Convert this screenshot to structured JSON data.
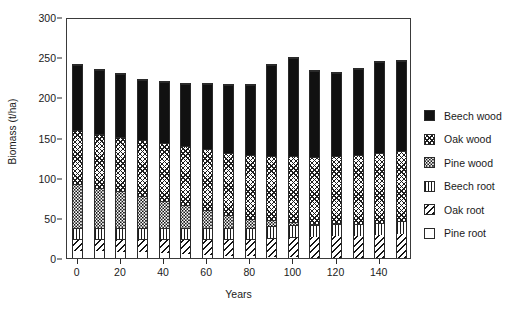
{
  "chart_data": {
    "type": "bar",
    "subtype": "stacked-bar",
    "title": "",
    "xlabel": "Years",
    "ylabel": "Biomass (t/ha)",
    "xlim": [
      -5,
      155
    ],
    "ylim": [
      0,
      300
    ],
    "ytick_values": [
      0,
      50,
      100,
      150,
      200,
      250,
      300
    ],
    "ytick_labels": [
      "0",
      "50",
      "100",
      "150",
      "200",
      "250",
      "300"
    ],
    "xtick_values": [
      0,
      20,
      40,
      60,
      80,
      100,
      120,
      140
    ],
    "xtick_labels": [
      "0",
      "20",
      "40",
      "60",
      "80",
      "100",
      "120",
      "140"
    ],
    "grid": false,
    "legend_position": "right",
    "x": [
      0,
      10,
      20,
      30,
      40,
      50,
      60,
      70,
      80,
      90,
      100,
      110,
      120,
      130,
      140,
      150
    ],
    "categories": [
      "0",
      "10",
      "20",
      "30",
      "40",
      "50",
      "60",
      "70",
      "80",
      "90",
      "100",
      "110",
      "120",
      "130",
      "140",
      "150"
    ],
    "stack_order_bottom_to_top": [
      "Pine root",
      "Oak root",
      "Beech root",
      "Pine wood",
      "Oak wood",
      "Beech wood"
    ],
    "series": [
      {
        "name": "Pine root",
        "pattern": "open-white",
        "values": [
          9,
          9,
          8,
          7,
          6,
          5,
          4,
          3,
          2,
          1,
          1,
          0,
          0,
          0,
          0,
          0
        ]
      },
      {
        "name": "Oak root",
        "pattern": "diagonal-hatch",
        "values": [
          15,
          15,
          16,
          17,
          18,
          19,
          20,
          21,
          22,
          24,
          25,
          26,
          27,
          28,
          29,
          30
        ]
      },
      {
        "name": "Beech root",
        "pattern": "vertical-lines",
        "values": [
          14,
          14,
          14,
          14,
          14,
          14,
          14,
          14,
          14,
          15,
          15,
          15,
          15,
          15,
          15,
          16
        ]
      },
      {
        "name": "Pine wood",
        "pattern": "stipple-dots",
        "values": [
          54,
          50,
          46,
          40,
          34,
          28,
          22,
          16,
          11,
          7,
          4,
          2,
          1,
          0,
          0,
          0
        ]
      },
      {
        "name": "Oak wood",
        "pattern": "cross-hatch",
        "values": [
          68,
          67,
          68,
          70,
          72,
          74,
          76,
          78,
          80,
          81,
          83,
          84,
          85,
          86,
          87,
          88
        ]
      },
      {
        "name": "Beech wood",
        "pattern": "solid-black",
        "values": [
          82,
          80,
          78,
          75,
          76,
          78,
          82,
          85,
          88,
          113,
          122,
          107,
          103,
          108,
          114,
          113
        ]
      }
    ],
    "totals": [
      242,
      235,
      230,
      223,
      220,
      218,
      218,
      217,
      217,
      241,
      250,
      234,
      231,
      237,
      245,
      247
    ]
  },
  "legend": {
    "items": [
      {
        "label": "Beech wood",
        "pattern_class": "fill-beech-wood"
      },
      {
        "label": "Oak wood",
        "pattern_class": "fill-oak-wood"
      },
      {
        "label": "Pine wood",
        "pattern_class": "fill-pine-wood"
      },
      {
        "label": "Beech root",
        "pattern_class": "fill-beech-root"
      },
      {
        "label": "Oak root",
        "pattern_class": "fill-oak-root"
      },
      {
        "label": "Pine root",
        "pattern_class": "fill-pine-root"
      }
    ]
  },
  "colors": {
    "axis": "#3a3a3a",
    "text": "#1a1a1a",
    "background": "#ffffff",
    "beech_wood": "#111111"
  }
}
